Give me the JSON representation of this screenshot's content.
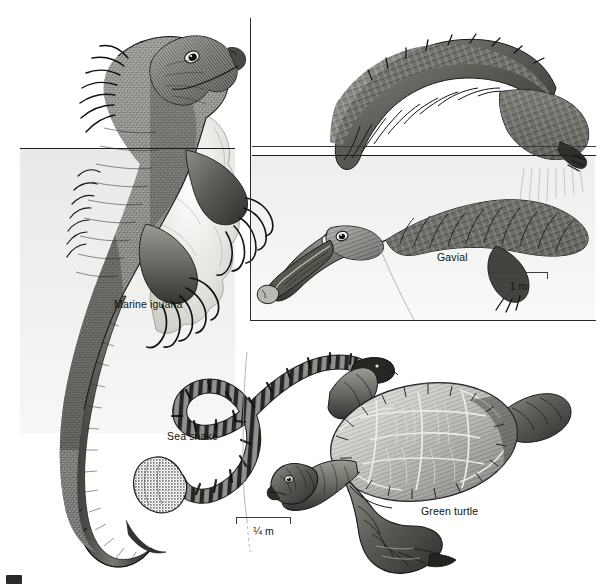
{
  "plate": {
    "title": "Marine reptiles",
    "background_color": "#ffffff",
    "ink_color": "#1d1d1d",
    "water_tint": "#ededeb",
    "width": 610,
    "height": 588
  },
  "labels": {
    "marine_iguana": "Marine iguana",
    "gavial": "Gavial",
    "sea_snake": "Sea snake",
    "green_turtle": "Green turtle"
  },
  "scale_bars": [
    {
      "name": "gavial-scale",
      "caption": "1 m",
      "length_px": 58
    },
    {
      "name": "snake-turtle-scale",
      "caption": "¼ m",
      "length_px": 54
    }
  ],
  "figures": [
    {
      "name": "marine-iguana",
      "label": "Marine iguana",
      "description": "Marine iguana clinging to a rock, head and shoulders above the waterline, long crested tail trailing below"
    },
    {
      "name": "gavial",
      "label": "Gavial",
      "description": "Gavial (gharial) swimming, narrow snout and body submerged, arched tail raised above the waterline"
    },
    {
      "name": "sea-snake",
      "label": "Sea snake",
      "description": "Banded sea snake with a flattened paddle tail, body in an S-curve"
    },
    {
      "name": "green-turtle",
      "label": "Green turtle",
      "description": "Green sea turtle seen from above and the side, scuted carapace and flippers"
    }
  ],
  "panel_borders": {
    "gavial_panel_left_x": 250,
    "gavial_panel_top_y": 18,
    "gavial_panel_right_x": 596,
    "gavial_panel_bottom_y": 320
  }
}
